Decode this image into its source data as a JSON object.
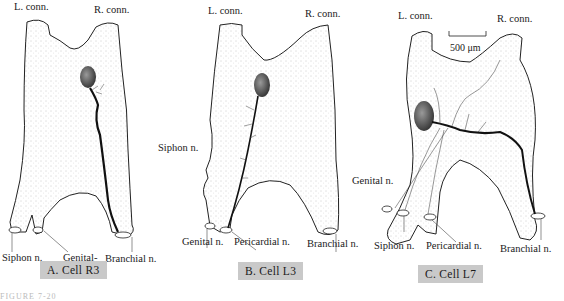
{
  "figure": {
    "caption_number_partial": "FIGURE 7-20",
    "panels": [
      {
        "id": "A",
        "caption": "A.  Cell R3",
        "labels": {
          "left_connective": "L. conn.",
          "right_connective": "R. conn.",
          "nerve_1": "Siphon n.",
          "nerve_2_line1": "Genital-",
          "nerve_2_line2": "pericardial n.",
          "nerve_3": "Branchial n."
        }
      },
      {
        "id": "B",
        "caption": "B.  Cell L3",
        "labels": {
          "left_connective": "L. conn.",
          "right_connective": "R. conn.",
          "side_nerve": "Siphon n.",
          "nerve_1": "Genital n.",
          "nerve_2": "Pericardial n.",
          "nerve_3": "Branchial n."
        }
      },
      {
        "id": "C",
        "caption": "C.  Cell L7",
        "labels": {
          "left_connective": "L. conn.",
          "right_connective": "R. conn.",
          "side_nerve": "Genital n.",
          "nerve_1": "Siphon n.",
          "nerve_2": "Pericardial n.",
          "nerve_3": "Branchial n."
        },
        "scale_bar": "500 μm"
      }
    ]
  }
}
